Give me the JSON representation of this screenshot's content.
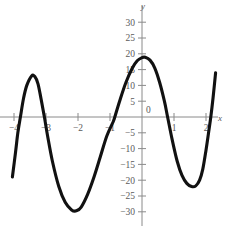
{
  "chart_data": {
    "type": "line",
    "title": "",
    "xlabel": "x",
    "ylabel": "y",
    "grid": false,
    "legend": "none",
    "xlim": [
      -4.2,
      2.45
    ],
    "ylim": [
      -32,
      32
    ],
    "x_ticks": [
      -4,
      -3,
      -2,
      -1,
      1,
      2
    ],
    "x_tick_labels": [
      "−4",
      "−3",
      "−2",
      "−1",
      "1",
      "2"
    ],
    "y_ticks": [
      30,
      25,
      20,
      15,
      10,
      5,
      -5,
      -10,
      -15,
      -20,
      -25,
      -30
    ],
    "y_tick_labels": [
      "30",
      "25",
      "20",
      "15",
      "10",
      "5",
      "−5",
      "−10",
      "−15",
      "−20",
      "−25",
      "−30"
    ],
    "origin_label": "0",
    "series": [
      {
        "name": "polynomial",
        "color": "#111111",
        "points": [
          [
            -4.05,
            -19.0
          ],
          [
            -3.95,
            -11.0
          ],
          [
            -3.88,
            -5.0
          ],
          [
            -3.8,
            0.0
          ],
          [
            -3.7,
            6.0
          ],
          [
            -3.6,
            10.0
          ],
          [
            -3.45,
            13.0
          ],
          [
            -3.35,
            12.8
          ],
          [
            -3.25,
            10.5
          ],
          [
            -3.15,
            5.5
          ],
          [
            -3.05,
            0.0
          ],
          [
            -2.95,
            -6.0
          ],
          [
            -2.8,
            -14.0
          ],
          [
            -2.6,
            -22.0
          ],
          [
            -2.4,
            -27.0
          ],
          [
            -2.2,
            -29.4
          ],
          [
            -2.05,
            -29.7
          ],
          [
            -1.9,
            -28.5
          ],
          [
            -1.7,
            -24.5
          ],
          [
            -1.5,
            -19.0
          ],
          [
            -1.3,
            -12.5
          ],
          [
            -1.1,
            -6.0
          ],
          [
            -0.9,
            -1.5
          ],
          [
            -0.85,
            0.0
          ],
          [
            -0.7,
            5.0
          ],
          [
            -0.5,
            11.0
          ],
          [
            -0.3,
            15.5
          ],
          [
            -0.15,
            17.8
          ],
          [
            0.0,
            18.8
          ],
          [
            0.1,
            18.9
          ],
          [
            0.25,
            18.0
          ],
          [
            0.4,
            15.5
          ],
          [
            0.55,
            11.0
          ],
          [
            0.7,
            5.0
          ],
          [
            0.8,
            0.0
          ],
          [
            0.95,
            -7.5
          ],
          [
            1.1,
            -14.0
          ],
          [
            1.25,
            -18.5
          ],
          [
            1.4,
            -21.0
          ],
          [
            1.55,
            -22.0
          ],
          [
            1.68,
            -21.8
          ],
          [
            1.8,
            -20.0
          ],
          [
            1.9,
            -16.5
          ],
          [
            2.0,
            -10.5
          ],
          [
            2.08,
            -5.0
          ],
          [
            2.15,
            0.0
          ],
          [
            2.22,
            6.0
          ],
          [
            2.3,
            14.0
          ]
        ]
      }
    ],
    "annotations": {
      "left_peak": {
        "x": -3.4,
        "y": 13
      },
      "left_valley": {
        "x": -2.1,
        "y": -29.7
      },
      "center_peak": {
        "x": 0.05,
        "y": 18.9
      },
      "right_valley": {
        "x": 1.62,
        "y": -22
      }
    }
  }
}
